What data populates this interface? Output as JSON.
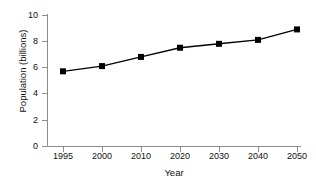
{
  "chart_data": {
    "type": "line",
    "title": "",
    "xlabel": "Year",
    "ylabel": "Population (billions)",
    "categories": [
      "1995",
      "2000",
      "2010",
      "2020",
      "2030",
      "2040",
      "2050"
    ],
    "x": [
      1995,
      2000,
      2010,
      2020,
      2030,
      2040,
      2050
    ],
    "values": [
      5.7,
      6.1,
      6.8,
      7.5,
      7.8,
      8.1,
      8.9
    ],
    "series": [
      {
        "name": "World population",
        "values": [
          5.7,
          6.1,
          6.8,
          7.5,
          7.8,
          8.1,
          8.9
        ]
      }
    ],
    "ylim": [
      0,
      10
    ],
    "yticks": [
      "0",
      "2",
      "4",
      "6",
      "8",
      "10"
    ],
    "ytick_values": [
      0,
      2,
      4,
      6,
      8,
      10
    ],
    "xticks": [
      "1995",
      "2000",
      "2010",
      "2020",
      "2030",
      "2040",
      "2050"
    ],
    "grid": false,
    "legend": false,
    "legend_position": "none",
    "marker": "square",
    "line_color": "#000000",
    "marker_color": "#000000",
    "axis_color": "#8c8c8c",
    "background_color": "#ffffff"
  }
}
